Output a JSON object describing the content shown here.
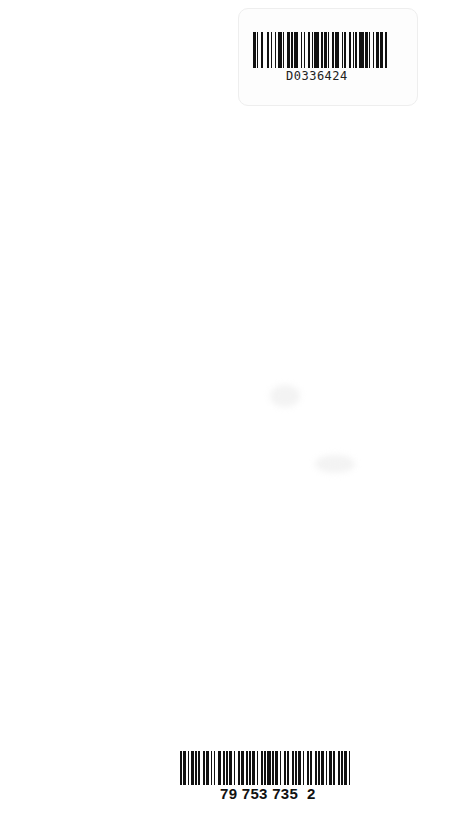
{
  "page": {
    "type": "scanned blank page",
    "background": "#ffffff"
  },
  "top_barcode": {
    "code": "D0336424",
    "pattern": [
      2,
      1,
      1,
      2,
      1,
      3,
      2,
      1,
      1,
      2,
      1,
      1,
      3,
      1,
      1,
      2,
      2,
      1,
      1,
      1,
      3,
      2,
      1,
      1,
      1,
      2,
      2,
      1,
      1,
      1,
      3,
      2,
      1,
      1,
      2,
      1,
      1,
      2,
      1,
      1,
      3,
      2,
      1,
      1,
      1,
      2,
      2,
      1,
      1,
      1,
      1,
      2,
      3,
      1,
      2,
      1,
      1,
      2,
      1,
      1,
      2,
      1,
      2,
      2,
      1,
      1
    ]
  },
  "bottom_barcode": {
    "code": "79 753 735  2",
    "pattern": [
      1,
      1,
      2,
      1,
      1,
      1,
      2,
      1,
      1,
      1,
      1,
      2,
      1,
      1,
      2,
      1,
      1,
      1,
      1,
      2,
      2,
      1,
      1,
      1,
      1,
      1,
      2,
      1,
      1,
      2,
      1,
      1,
      2,
      1,
      1,
      1,
      1,
      1,
      2,
      1,
      1,
      2,
      1,
      1,
      1,
      1,
      2,
      1,
      1,
      1,
      2,
      1,
      1,
      2,
      1,
      1,
      1,
      2,
      1,
      1,
      1,
      1,
      2,
      1,
      1,
      2,
      1,
      1,
      1,
      2,
      1,
      1,
      1,
      1,
      2,
      1,
      1,
      1,
      2,
      1,
      1,
      2,
      1,
      1,
      1,
      1,
      2,
      1,
      1,
      2
    ]
  }
}
